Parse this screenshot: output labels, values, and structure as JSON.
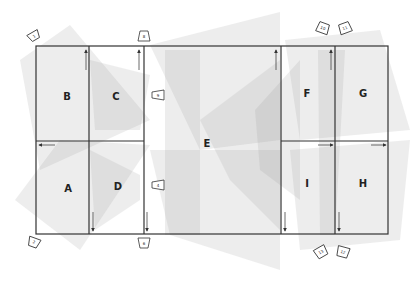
{
  "diagram": {
    "frame": {
      "x": 36,
      "y": 46,
      "width": 352,
      "height": 188,
      "stroke": "#333333"
    },
    "regions": [
      {
        "id": "B",
        "label": "B",
        "cx": 67,
        "cy": 96
      },
      {
        "id": "C",
        "label": "C",
        "cx": 116,
        "cy": 96
      },
      {
        "id": "A",
        "label": "A",
        "cx": 68,
        "cy": 188
      },
      {
        "id": "D",
        "label": "D",
        "cx": 118,
        "cy": 186
      },
      {
        "id": "E",
        "label": "E",
        "cx": 207,
        "cy": 143
      },
      {
        "id": "F",
        "label": "F",
        "cx": 307,
        "cy": 93
      },
      {
        "id": "G",
        "label": "G",
        "cx": 363,
        "cy": 93
      },
      {
        "id": "I",
        "label": "I",
        "cx": 307,
        "cy": 183
      },
      {
        "id": "H",
        "label": "H",
        "cx": 363,
        "cy": 183
      }
    ],
    "markers": [
      {
        "id": "m1",
        "label": "1",
        "x": 34,
        "y": 36,
        "rot": -30
      },
      {
        "id": "m8",
        "label": "8",
        "x": 144,
        "y": 36,
        "rot": 0
      },
      {
        "id": "m9",
        "label": "9",
        "x": 158,
        "y": 95,
        "rot": -90
      },
      {
        "id": "m4",
        "label": "4",
        "x": 158,
        "y": 185,
        "rot": -90
      },
      {
        "id": "m2",
        "label": "2",
        "x": 34,
        "y": 242,
        "rot": 200
      },
      {
        "id": "m6",
        "label": "6",
        "x": 144,
        "y": 243,
        "rot": 180
      },
      {
        "id": "m10",
        "label": "10",
        "x": 323,
        "y": 28,
        "rot": 20
      },
      {
        "id": "m11",
        "label": "11",
        "x": 345,
        "y": 28,
        "rot": -20
      },
      {
        "id": "m13",
        "label": "13",
        "x": 321,
        "y": 252,
        "rot": 150
      },
      {
        "id": "m12",
        "label": "12",
        "x": 343,
        "y": 252,
        "rot": 200
      }
    ],
    "arrows": [
      {
        "id": "up-1",
        "dir": "up",
        "x": 86,
        "y1": 70,
        "y2": 50
      },
      {
        "id": "up-2",
        "dir": "up",
        "x": 139,
        "y1": 70,
        "y2": 50
      },
      {
        "id": "up-3",
        "dir": "up",
        "x": 276,
        "y1": 70,
        "y2": 50
      },
      {
        "id": "up-4",
        "dir": "up",
        "x": 331,
        "y1": 70,
        "y2": 50
      },
      {
        "id": "down-1",
        "dir": "down",
        "x": 93,
        "y1": 212,
        "y2": 231
      },
      {
        "id": "down-2",
        "dir": "down",
        "x": 147,
        "y1": 212,
        "y2": 231
      },
      {
        "id": "down-3",
        "dir": "down",
        "x": 285,
        "y1": 212,
        "y2": 231
      },
      {
        "id": "down-4",
        "dir": "down",
        "x": 339,
        "y1": 212,
        "y2": 231
      },
      {
        "id": "left-1",
        "dir": "left",
        "y": 145,
        "x1": 55,
        "x2": 39
      },
      {
        "id": "right-1",
        "dir": "right",
        "y": 145,
        "x1": 318,
        "x2": 333
      },
      {
        "id": "right-2",
        "dir": "right",
        "y": 145,
        "x1": 371,
        "x2": 386
      }
    ],
    "colors": {
      "line": "#333333",
      "shade": "#9a9a9a",
      "background": "#ffffff"
    }
  }
}
